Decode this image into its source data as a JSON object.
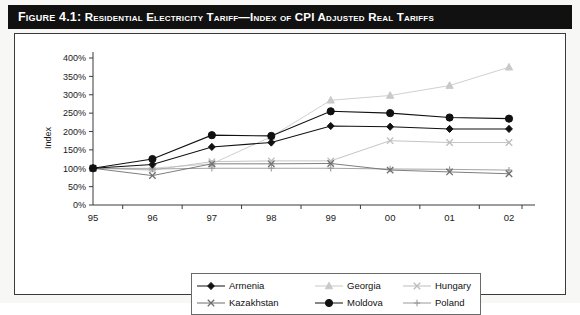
{
  "figure": {
    "title_lead": "Figure 4.1:",
    "title_rest": "Residential Electricity Tariff—Index of CPI Adjusted Real Tariffs",
    "title_full": "Figure 4.1: Residential Electricity Tariff—Index of CPI Adjusted Real Tariffs"
  },
  "chart_data": {
    "type": "line",
    "title": "Residential Electricity Tariff—Index of CPI Adjusted Real Tariffs",
    "xlabel": "",
    "ylabel": "Index",
    "categories": [
      "95",
      "96",
      "97",
      "98",
      "99",
      "00",
      "01",
      "02"
    ],
    "x": [
      "95",
      "96",
      "97",
      "98",
      "99",
      "00",
      "01",
      "02"
    ],
    "ylim": [
      0,
      400
    ],
    "yticks": [
      "0%",
      "50%",
      "100%",
      "150%",
      "200%",
      "250%",
      "300%",
      "350%",
      "400%"
    ],
    "ytick_values": [
      0,
      50,
      100,
      150,
      200,
      250,
      300,
      350,
      400
    ],
    "ytick_step": 50,
    "grid": false,
    "legend_position": "bottom",
    "value_unit": "%",
    "series": [
      {
        "name": "Armenia",
        "marker": "diamond",
        "marker_filled": true,
        "color": "#111111",
        "values": [
          100,
          110,
          158,
          170,
          215,
          213,
          207,
          207
        ]
      },
      {
        "name": "Georgia",
        "marker": "triangle",
        "marker_filled": true,
        "color": "#c9c9c9",
        "values": [
          100,
          100,
          112,
          186,
          285,
          298,
          325,
          375
        ]
      },
      {
        "name": "Hungary",
        "marker": "x",
        "marker_filled": false,
        "color": "#bdbdbd",
        "values": [
          100,
          95,
          118,
          120,
          120,
          175,
          170,
          170
        ]
      },
      {
        "name": "Kazakhstan",
        "marker": "x",
        "marker_filled": false,
        "color": "#6f6f6f",
        "values": [
          100,
          80,
          112,
          112,
          113,
          95,
          90,
          85
        ]
      },
      {
        "name": "Moldova",
        "marker": "circle",
        "marker_filled": true,
        "color": "#111111",
        "values": [
          100,
          125,
          190,
          188,
          255,
          250,
          238,
          235
        ]
      },
      {
        "name": "Poland",
        "marker": "plus",
        "marker_filled": false,
        "color": "#9a9a9a",
        "values": [
          100,
          98,
          100,
          100,
          100,
          98,
          97,
          95
        ]
      }
    ]
  },
  "legend": {
    "rows": [
      [
        {
          "name": "Armenia",
          "marker": "diamond",
          "color": "#111111"
        },
        {
          "name": "Georgia",
          "marker": "triangle",
          "color": "#c9c9c9"
        },
        {
          "name": "Hungary",
          "marker": "x",
          "color": "#bdbdbd"
        }
      ],
      [
        {
          "name": "Kazakhstan",
          "marker": "x",
          "color": "#6f6f6f"
        },
        {
          "name": "Moldova",
          "marker": "circle",
          "color": "#111111"
        },
        {
          "name": "Poland",
          "marker": "plus",
          "color": "#9a9a9a"
        }
      ]
    ]
  }
}
